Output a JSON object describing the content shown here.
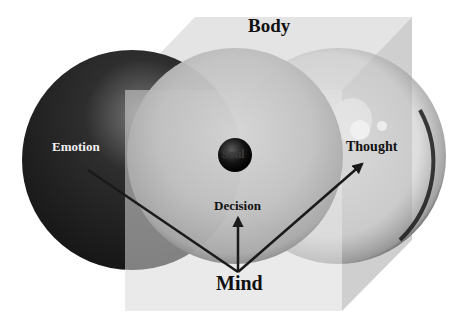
{
  "diagram": {
    "labels": {
      "body": "Body",
      "emotion": "Emotion",
      "soul": "Soul",
      "thought": "Thought",
      "decision": "Decision",
      "mind": "Mind"
    },
    "colors": {
      "background": "#ffffff",
      "cube_face": "#d8d8d8",
      "emotion_sphere": "#1c1c1c",
      "decision_sphere": "#bdbdbd",
      "thought_sphere": "#cfcfcf",
      "soul_sphere": "#0c0c0c",
      "arrow": "#1a1a1a",
      "label_dark": "#111111",
      "label_light": "#f2f2f2"
    }
  }
}
